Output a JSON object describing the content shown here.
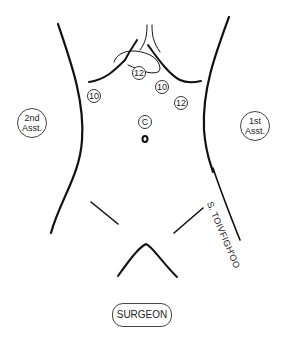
{
  "figure": {
    "ports": [
      {
        "label": "12",
        "x": 138,
        "y": 72
      },
      {
        "label": "10",
        "x": 93,
        "y": 95
      },
      {
        "label": "10",
        "x": 161,
        "y": 85
      },
      {
        "label": "12",
        "x": 180,
        "y": 101
      },
      {
        "label": "C",
        "x": 140,
        "y": 120
      }
    ],
    "umbilicus": {
      "x": 145,
      "y": 138
    },
    "positions": {
      "second_assistant": "2nd Asst.",
      "first_assistant": "1st Asst.",
      "surgeon": "SURGEON"
    },
    "signature": "S. TOIVFIGH'OO",
    "colors": {
      "line": "#111111",
      "background": "#ffffff"
    }
  }
}
